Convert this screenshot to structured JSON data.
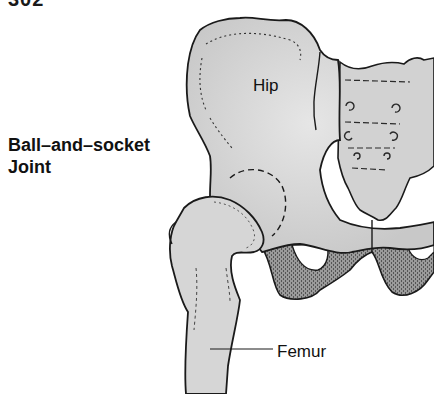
{
  "page": {
    "number_fragment": "302"
  },
  "figure": {
    "labels": {
      "joint_line1": "Ball–and–socket",
      "joint_line2": "Joint",
      "hip": "Hip",
      "femur": "Femur"
    },
    "colors": {
      "background": "#ffffff",
      "bone_fill": "#d9d9d9",
      "bone_shade": "#bdbdbd",
      "cartilage_stipple": "#8c8c8c",
      "outline": "#1a1a1a",
      "text": "#111111"
    }
  }
}
